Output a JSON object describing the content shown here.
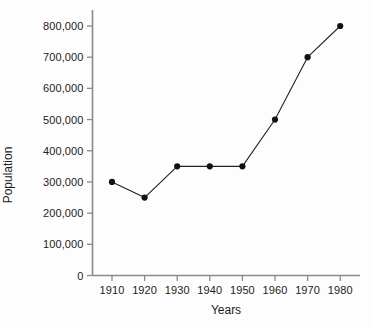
{
  "chart_data": {
    "type": "line",
    "title": "",
    "xlabel": "Years",
    "ylabel": "Population",
    "x": [
      1910,
      1920,
      1930,
      1940,
      1950,
      1960,
      1970,
      1980
    ],
    "values": [
      300000,
      250000,
      350000,
      350000,
      350000,
      500000,
      700000,
      800000
    ],
    "series": [
      {
        "name": "Population",
        "values": [
          300000,
          250000,
          350000,
          350000,
          350000,
          500000,
          700000,
          800000
        ]
      }
    ],
    "xlim": [
      1905,
      1985
    ],
    "ylim": [
      0,
      800000
    ],
    "x_tick_labels": [
      "1910",
      "1920",
      "1930",
      "1940",
      "1950",
      "1960",
      "1970",
      "1980"
    ],
    "y_tick_values": [
      0,
      100000,
      200000,
      300000,
      400000,
      500000,
      600000,
      700000,
      800000
    ],
    "y_tick_labels": [
      "0",
      "100,000",
      "200,000",
      "300,000",
      "400,000",
      "500,000",
      "600,000",
      "700,000",
      "800,000"
    ],
    "grid": false,
    "legend": null,
    "marker": "filled-circle",
    "line_color": "#222222",
    "marker_color": "#111111",
    "axis_color": "#8a8a8a",
    "text_color": "#1c1c1c",
    "background_color": "#fdfdfd"
  }
}
